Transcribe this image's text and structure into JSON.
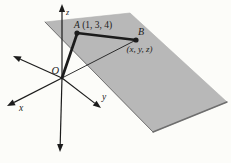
{
  "meta": {
    "background": "#fcfcf9",
    "ink": "#1c1c1c"
  },
  "plane": {
    "fill": "#b8b8b8",
    "outline": "#aeaeae",
    "corners": [
      [
        45,
        22
      ],
      [
        130,
        13
      ],
      [
        227,
        102
      ],
      [
        153,
        132
      ]
    ],
    "edges": [
      {
        "name": "plane-left-edge",
        "from": 0,
        "to": 3,
        "color": "#5f5f5f",
        "width": 0.8
      },
      {
        "name": "plane-front-edge",
        "from": 3,
        "to": 2,
        "color": "#6e6e6e",
        "width": 1.5
      }
    ]
  },
  "origin": {
    "label": "O",
    "x": 62,
    "y": 78,
    "label_x": 51.5,
    "label_y": 73.5
  },
  "axes": [
    {
      "name": "axis-z-positive",
      "tip": [
        62,
        4
      ],
      "label": "z",
      "label_x": 66,
      "label_y": 15
    },
    {
      "name": "axis-z-negative",
      "tip": [
        60,
        152
      ],
      "label": ""
    },
    {
      "name": "axis-back-left",
      "tip": [
        13,
        56
      ],
      "label": ""
    },
    {
      "name": "axis-x",
      "tip": [
        7,
        106
      ],
      "label": "x",
      "label_x": 19,
      "label_y": 110.5
    },
    {
      "name": "axis-y",
      "tip": [
        101,
        108
      ],
      "label": "y",
      "label_x": 102,
      "label_y": 99.5
    }
  ],
  "segments": [
    {
      "name": "segment-OB",
      "x1": 62,
      "y1": 78,
      "x2": 136,
      "y2": 40,
      "width": 0.9
    },
    {
      "name": "segment-OA",
      "x1": 62,
      "y1": 78,
      "x2": 77,
      "y2": 34,
      "width": 2.7
    },
    {
      "name": "segment-AB",
      "x1": 77,
      "y1": 33,
      "x2": 136,
      "y2": 40,
      "width": 2.7
    }
  ],
  "points": [
    {
      "name": "point-A",
      "x": 77,
      "y": 33,
      "letter": "A",
      "coords": " (1, 3, 4)",
      "label_x": 74,
      "label_y": 28,
      "inline_coords": true
    },
    {
      "name": "point-B",
      "x": 136,
      "y": 40,
      "letter": "B",
      "coords": "(x, y, z)",
      "label_x": 138,
      "label_y": 34.5,
      "coords_x": 126.5,
      "coords_y": 51.5,
      "inline_coords": false
    }
  ]
}
